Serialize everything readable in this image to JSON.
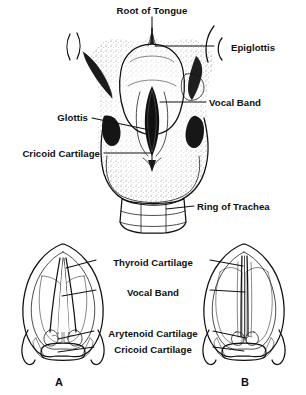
{
  "figure": {
    "title_implied": "Larynx and vocal bands",
    "background_color": "#ffffff",
    "ink_color": "#111111",
    "upper_panel": {
      "view": "laryngoscopic mirror view of larynx from above",
      "labels": [
        {
          "id": "root-of-tongue",
          "text": "Root of Tongue",
          "position": "top-center",
          "x": 152,
          "y": 11,
          "anchor": "middle",
          "leader": "vertical line down to tongue base"
        },
        {
          "id": "epiglottis",
          "text": "Epiglottis",
          "position": "right",
          "x": 231,
          "y": 48,
          "anchor": "start",
          "leader": "horizontal line left to curved bracket"
        },
        {
          "id": "vocal-band",
          "text": "Vocal Band",
          "position": "right",
          "x": 208,
          "y": 103,
          "anchor": "start",
          "leader": "horizontal line left to glottic slit"
        },
        {
          "id": "glottis",
          "text": "Glottis",
          "position": "left",
          "x": 88,
          "y": 120,
          "anchor": "end",
          "leader": "horizontal line right to dark aperture"
        },
        {
          "id": "cricoid-cartilage",
          "text": "Cricoid Cartilage",
          "position": "left",
          "x": 100,
          "y": 155,
          "anchor": "end",
          "leader": "horizontal line right to stippled cricoid"
        },
        {
          "id": "ring-of-trachea",
          "text": "Ring of Trachea",
          "position": "right",
          "x": 196,
          "y": 207,
          "anchor": "start",
          "leader": "horizontal line left to tracheal ring"
        }
      ]
    },
    "lower_panel": {
      "view": "two superior views of the larynx comparing vocal band positions",
      "labels": [
        {
          "id": "thyroid-cartilage",
          "text": "Thyroid Cartilage",
          "x": 153,
          "y": 263,
          "anchor": "middle",
          "leader": "lines to both diagram A and B"
        },
        {
          "id": "vocal-band",
          "text": "Vocal Band",
          "x": 153,
          "y": 293,
          "anchor": "middle",
          "leader": "lines to both diagram A and B"
        },
        {
          "id": "arytenoid-cartilage",
          "text": "Arytenoid Cartilage",
          "x": 153,
          "y": 334,
          "anchor": "middle",
          "leader": "lines to both diagram A and B"
        },
        {
          "id": "cricoid-cartilage",
          "text": "Cricoid Cartilage",
          "x": 153,
          "y": 350,
          "anchor": "middle",
          "leader": "lines to both diagram A and B"
        }
      ],
      "diagrams": [
        {
          "id": "diagram-a",
          "caption": "A",
          "caption_x": 59,
          "caption_y": 383,
          "state": "vocal bands abducted, glottis open"
        },
        {
          "id": "diagram-b",
          "caption": "B",
          "caption_x": 245,
          "caption_y": 383,
          "state": "vocal bands adducted, glottis closed"
        }
      ]
    }
  }
}
